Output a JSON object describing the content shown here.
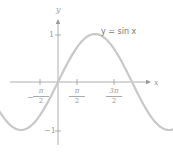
{
  "chart_data": {
    "type": "line",
    "title": "y = sin x",
    "xlabel": "x",
    "ylabel": "y",
    "function": "sin(x)",
    "x_range": [
      -2.6,
      5.4
    ],
    "ylim": [
      -1.4,
      1.6
    ],
    "x_ticks": [
      {
        "value": -1.5708,
        "label_num": "π",
        "label_den": "2",
        "sign": "−"
      },
      {
        "value": 1.5708,
        "label_num": "π",
        "label_den": "2",
        "sign": ""
      },
      {
        "value": 4.7124,
        "label_num": "3π",
        "label_den": "2",
        "sign": ""
      }
    ],
    "y_ticks": [
      {
        "value": 1,
        "label": "1"
      },
      {
        "value": -1,
        "label": "−1"
      }
    ],
    "grid": false,
    "legend": null,
    "curve_color": "#c8c8c8",
    "axis_color": "#9a9a9a"
  },
  "labels": {
    "title": "y = sin x",
    "x_axis": "x",
    "y_axis": "y",
    "y_tick_pos": "1",
    "y_tick_neg": "−1",
    "x_tick_neg_half_pi_num": "π",
    "x_tick_neg_half_pi_den": "2",
    "x_tick_neg_half_pi_sign": "−",
    "x_tick_half_pi_num": "π",
    "x_tick_half_pi_den": "2",
    "x_tick_three_half_pi_num": "3π",
    "x_tick_three_half_pi_den": "2"
  }
}
